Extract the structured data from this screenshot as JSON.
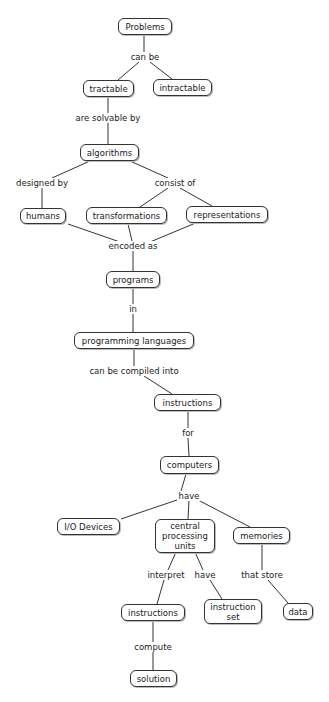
{
  "diagram": {
    "type": "concept-map",
    "nodes": [
      {
        "id": "problems",
        "label": "Problems"
      },
      {
        "id": "tractable",
        "label": "tractable"
      },
      {
        "id": "intractable",
        "label": "intractable"
      },
      {
        "id": "algorithms",
        "label": "algorithms"
      },
      {
        "id": "humans",
        "label": "humans"
      },
      {
        "id": "transformations",
        "label": "transformations"
      },
      {
        "id": "representations",
        "label": "representations"
      },
      {
        "id": "programs",
        "label": "programs"
      },
      {
        "id": "programming_languages",
        "label": "programming languages"
      },
      {
        "id": "instructions",
        "label": "instructions"
      },
      {
        "id": "computers",
        "label": "computers"
      },
      {
        "id": "io_devices",
        "label": "I/O Devices"
      },
      {
        "id": "cpu",
        "label": "central\nprocessing\nunits"
      },
      {
        "id": "memories",
        "label": "memories"
      },
      {
        "id": "instructions2",
        "label": "instructions"
      },
      {
        "id": "instruction_set",
        "label": "instruction\nset"
      },
      {
        "id": "data",
        "label": "data"
      },
      {
        "id": "solution",
        "label": "solution"
      }
    ],
    "link_labels": {
      "can_be": "can be",
      "are_solvable_by": "are solvable by",
      "designed_by": "designed by",
      "consist_of": "consist of",
      "encoded_as": "encoded as",
      "in": "in",
      "can_be_compiled_into": "can be compiled into",
      "for": "for",
      "have": "have",
      "interpret": "interpret",
      "have2": "have",
      "that_store": "that store",
      "compute": "compute"
    },
    "edges": [
      [
        "problems",
        "can be",
        "tractable"
      ],
      [
        "problems",
        "can be",
        "intractable"
      ],
      [
        "tractable",
        "are solvable by",
        "algorithms"
      ],
      [
        "algorithms",
        "designed by",
        "humans"
      ],
      [
        "algorithms",
        "consist of",
        "transformations"
      ],
      [
        "algorithms",
        "consist of",
        "representations"
      ],
      [
        "humans",
        "encoded as",
        "programs"
      ],
      [
        "transformations",
        "encoded as",
        "programs"
      ],
      [
        "representations",
        "encoded as",
        "programs"
      ],
      [
        "programs",
        "in",
        "programming languages"
      ],
      [
        "programming languages",
        "can be compiled into",
        "instructions"
      ],
      [
        "instructions",
        "for",
        "computers"
      ],
      [
        "computers",
        "have",
        "I/O Devices"
      ],
      [
        "computers",
        "have",
        "central processing units"
      ],
      [
        "computers",
        "have",
        "memories"
      ],
      [
        "central processing units",
        "interpret",
        "instructions"
      ],
      [
        "central processing units",
        "have",
        "instruction set"
      ],
      [
        "memories",
        "that store",
        "data"
      ],
      [
        "instructions",
        "compute",
        "solution"
      ]
    ]
  }
}
